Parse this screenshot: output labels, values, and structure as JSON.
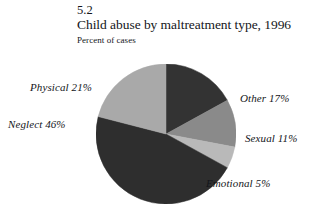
{
  "figure": {
    "number": "5.2",
    "title": "Child abuse by maltreatment type, 1996",
    "subtitle": "Percent of cases"
  },
  "labels": {
    "physical": "Physical  21%",
    "neglect": "Neglect 46%",
    "other": "Other 17%",
    "sexual": "Sexual 11%",
    "emotional": "Emotional 5%"
  },
  "colors": {
    "other": "#333333",
    "sexual": "#8a8a8a",
    "emotional": "#b9b9b9",
    "neglect": "#2e2e2e",
    "physical": "#a9a9a9",
    "text": "#14161a",
    "background": "#ffffff"
  },
  "chart_data": {
    "type": "pie",
    "title": "Child abuse by maltreatment type, 1996",
    "subtitle": "Percent of cases",
    "figure_number": "5.2",
    "ylabel": "",
    "xlabel": "",
    "units": "percent of cases",
    "legend_position": "outside-labels",
    "grid": false,
    "start_angle_deg": 0,
    "direction": "clockwise",
    "categories": [
      "Other",
      "Sexual",
      "Emotional",
      "Neglect",
      "Physical"
    ],
    "values": [
      17,
      11,
      5,
      46,
      21
    ],
    "slices": [
      {
        "name": "Other",
        "value": 17,
        "label": "Other 17%",
        "color": "#333333"
      },
      {
        "name": "Sexual",
        "value": 11,
        "label": "Sexual 11%",
        "color": "#8a8a8a"
      },
      {
        "name": "Emotional",
        "value": 5,
        "label": "Emotional 5%",
        "color": "#b9b9b9"
      },
      {
        "name": "Neglect",
        "value": 46,
        "label": "Neglect 46%",
        "color": "#2e2e2e"
      },
      {
        "name": "Physical",
        "value": 21,
        "label": "Physical  21%",
        "color": "#a9a9a9"
      }
    ],
    "total": 100
  }
}
